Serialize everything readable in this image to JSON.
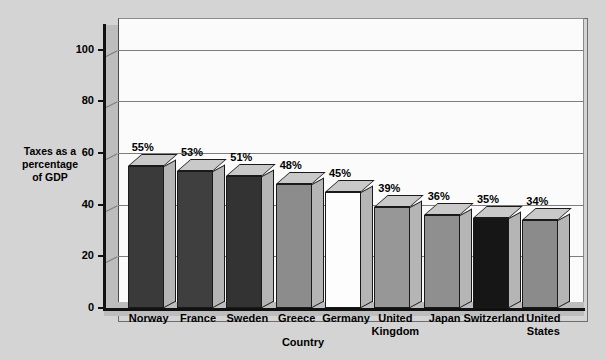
{
  "chart_data": {
    "type": "bar",
    "title": "",
    "xlabel": "Country",
    "ylabel": "Taxes as a percentage of GDP",
    "ylabel_lines": [
      "Taxes as a",
      "percentage",
      "of GDP"
    ],
    "ylim": [
      0,
      110
    ],
    "yticks": [
      0,
      20,
      40,
      60,
      80,
      100
    ],
    "ytick_labels": [
      "0",
      "20",
      "40",
      "60",
      "80",
      "100"
    ],
    "grid": true,
    "legend": "none",
    "value_suffix": "%",
    "categories": [
      "Norway",
      "France",
      "Sweden",
      "Greece",
      "Germany",
      "United Kingdom",
      "Japan",
      "Switzerland",
      "United States"
    ],
    "category_lines": [
      [
        "Norway"
      ],
      [
        "France"
      ],
      [
        "Sweden"
      ],
      [
        "Greece"
      ],
      [
        "Germany"
      ],
      [
        "United",
        "Kingdom"
      ],
      [
        "Japan"
      ],
      [
        "Switzerland"
      ],
      [
        "United",
        "States"
      ]
    ],
    "values": [
      55,
      53,
      51,
      48,
      45,
      39,
      36,
      35,
      34
    ],
    "data_labels": [
      "55%",
      "53%",
      "51%",
      "48%",
      "45%",
      "39%",
      "36%",
      "35%",
      "34%"
    ],
    "bar_colors": [
      "#3a3a3a",
      "#3f3f3f",
      "#333333",
      "#8c8c8c",
      "#fdfdfd",
      "#979797",
      "#8f8f8f",
      "#161616",
      "#8b8b8b"
    ],
    "plot_background": "#fbfbfb",
    "page_background": "#d4d4d4",
    "axis_color": "#111111",
    "gridline_color": "#7d7d7d",
    "wall_color": "#bdbdbd"
  }
}
